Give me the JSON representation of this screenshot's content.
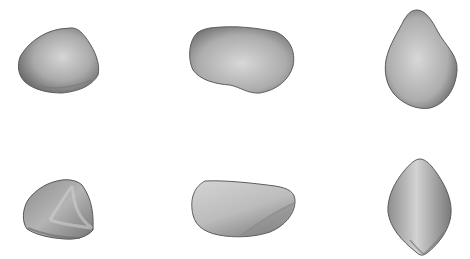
{
  "figure": {
    "background": "#ffffff",
    "layout": {
      "rows": 2,
      "cols": 3
    },
    "subjects": [
      {
        "id": "top-left",
        "description": "rounded triangular asteroid shape model, smooth shading",
        "fill_light": "#d2d2d2",
        "fill_dark": "#6e6e6e"
      },
      {
        "id": "top-center",
        "description": "elongated bean-shaped asteroid model, smooth shading",
        "fill_light": "#d4d4d4",
        "fill_dark": "#707070"
      },
      {
        "id": "top-right",
        "description": "upright egg-shaped asteroid model, smooth shading",
        "fill_light": "#d6d6d6",
        "fill_dark": "#6c6c6c"
      },
      {
        "id": "bottom-left",
        "description": "faceted dome-shaped asteroid model",
        "fill_light": "#cfcfcf",
        "fill_dark": "#6a6a6a"
      },
      {
        "id": "bottom-center",
        "description": "faceted wedge-shaped elongated asteroid model",
        "fill_light": "#d8d8d8",
        "fill_dark": "#727272"
      },
      {
        "id": "bottom-right",
        "description": "faceted pointed-oval asteroid model",
        "fill_light": "#d6d6d6",
        "fill_dark": "#6c6c6c"
      }
    ]
  }
}
